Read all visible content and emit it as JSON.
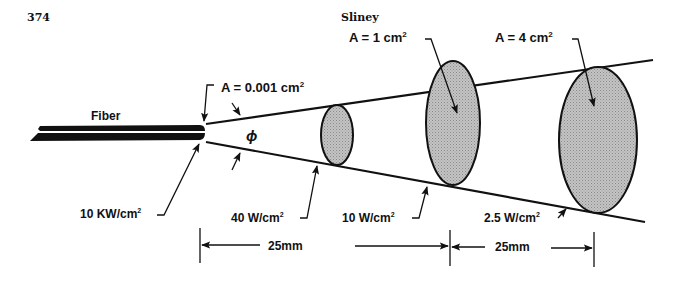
{
  "header": {
    "page_number": "374",
    "running_head": "Sliney"
  },
  "diagram": {
    "fiber_label": "Fiber",
    "angle_symbol": "ϕ",
    "areas": [
      {
        "label": "A = 0.001 cm²",
        "text": "A = 0.001 cm",
        "sup": "2"
      },
      {
        "label": "A = 1 cm²",
        "text": "A = 1 cm",
        "sup": "2"
      },
      {
        "label": "A = 4 cm²",
        "text": "A = 4 cm",
        "sup": "2"
      }
    ],
    "irradiances": [
      {
        "label": "10 KW/cm²",
        "text": "10 KW/cm",
        "sup": "2"
      },
      {
        "label": "40 W/cm²",
        "text": "40 W/cm",
        "sup": "2"
      },
      {
        "label": "10 W/cm²",
        "text": "10 W/cm",
        "sup": "2"
      },
      {
        "label": "2.5 W/cm²",
        "text": "2.5 W/cm",
        "sup": "2"
      }
    ],
    "distances": [
      {
        "label": "25mm"
      },
      {
        "label": "25mm"
      }
    ],
    "colors": {
      "line": "#111111",
      "spot_fill": "#b9b9b9",
      "background": "#ffffff"
    }
  }
}
